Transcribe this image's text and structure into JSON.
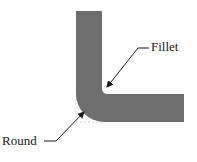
{
  "diagram": {
    "type": "L-shaped part cross-section",
    "labels": {
      "fillet": "Fillet",
      "round": "Round"
    },
    "colors": {
      "part_fill": "#6e6e6e",
      "leader_line": "#1a1a1a",
      "construction_line": "#c8c8c8",
      "background": "#ffffff"
    },
    "annotations": [
      {
        "label": "Fillet",
        "target": "inner concave corner"
      },
      {
        "label": "Round",
        "target": "outer convex corner"
      }
    ]
  }
}
